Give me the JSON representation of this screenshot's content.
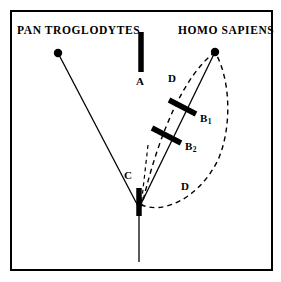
{
  "figure": {
    "type": "phylogenetic-tree-diagram",
    "background_color": "#ffffff",
    "ink_color": "#000000",
    "frame": {
      "x": 11,
      "y": 11,
      "width": 261,
      "height": 259,
      "stroke_width": 2
    }
  },
  "taxa": [
    {
      "id": "pan",
      "label": "PAN  TROGLODYTES",
      "label_x": 17,
      "label_y": 25,
      "tip_x": 58,
      "tip_y": 53,
      "tip_radius": 4.2
    },
    {
      "id": "homo",
      "label": "HOMO SAPIENS",
      "label_x": 178,
      "label_y": 25,
      "tip_x": 215,
      "tip_y": 52,
      "tip_radius": 4.2
    }
  ],
  "root": {
    "junction_x": 139,
    "junction_y": 208,
    "stem_bottom_y": 262
  },
  "branches": [
    {
      "id": "branch-pan",
      "x1": 58,
      "y1": 53,
      "x2": 139,
      "y2": 208,
      "stroke_width": 1.3
    },
    {
      "id": "branch-homo",
      "x1": 215,
      "y1": 52,
      "x2": 139,
      "y2": 208,
      "stroke_width": 1.3
    },
    {
      "id": "branch-stem",
      "x1": 139,
      "y1": 208,
      "x2": 139,
      "y2": 262,
      "stroke_width": 1.3
    }
  ],
  "events": [
    {
      "id": "A",
      "label": "A",
      "marker": {
        "x1": 141,
        "y1": 32,
        "x2": 141,
        "y2": 72,
        "stroke_width": 5.5
      },
      "label_x": 136,
      "label_y": 76
    },
    {
      "id": "B1",
      "label": "B",
      "subscript": "1",
      "marker": {
        "x1": 169,
        "y1": 100,
        "x2": 196,
        "y2": 114,
        "stroke_width": 5.5
      },
      "label_x": 200,
      "label_y": 113
    },
    {
      "id": "B2",
      "label": "B",
      "subscript": "2",
      "marker": {
        "x1": 152,
        "y1": 128,
        "x2": 181,
        "y2": 143,
        "stroke_width": 5.5
      },
      "label_x": 185,
      "label_y": 141
    },
    {
      "id": "C",
      "label": "C",
      "marker": {
        "x1": 139,
        "y1": 188,
        "x2": 139,
        "y2": 216,
        "stroke_width": 5.5
      },
      "label_x": 124,
      "label_y": 170
    }
  ],
  "clade_envelope": {
    "id": "D",
    "style": "dashed",
    "stroke_width": 1.4,
    "dash": "5,4",
    "path": "M 215 52 C 186 74, 160 128, 142 205 C 162 214, 198 200, 218 160 C 232 128, 231 80, 215 52 Z",
    "labels": [
      {
        "label": "D",
        "x": 168,
        "y": 73
      },
      {
        "label": "D",
        "x": 181,
        "y": 181
      }
    ]
  },
  "divergence_guide": {
    "id": "divergence-dashed-stem",
    "style": "dashed",
    "stroke_width": 1.2,
    "dash": "4,3.5",
    "x1": 148,
    "y1": 145,
    "x2": 141,
    "y2": 207
  }
}
